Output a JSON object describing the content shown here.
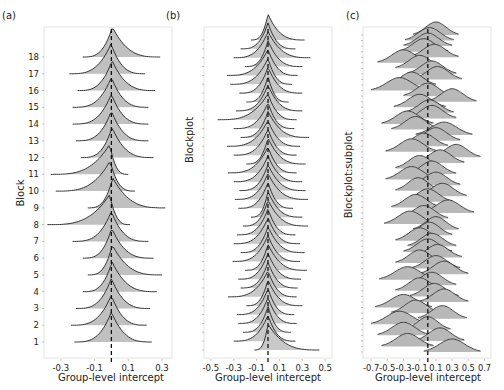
{
  "chart_data": [
    {
      "type": "ridgeline",
      "panel_label": "(a)",
      "title": "",
      "xlabel": "Group-level intercept",
      "ylabel": "Block",
      "xlim": [
        -0.4,
        0.36
      ],
      "xticks": [
        -0.3,
        -0.1,
        0.1,
        0.3
      ],
      "xtick_labels": [
        "-0.3",
        "-0.1",
        "0.1",
        "0.3"
      ],
      "yticks": [
        "1",
        "2",
        "3",
        "4",
        "5",
        "6",
        "7",
        "8",
        "9",
        "10",
        "11",
        "12",
        "13",
        "14",
        "15",
        "16",
        "17",
        "18"
      ],
      "reference_line": 0,
      "fill_color": "#c0c0c0",
      "line_color": "#222222",
      "rows": [
        {
          "label": "1",
          "left": -0.22,
          "right": 0.24,
          "skew": 0.0
        },
        {
          "label": "2",
          "left": -0.24,
          "right": 0.21,
          "skew": 0.0
        },
        {
          "label": "3",
          "left": -0.21,
          "right": 0.23,
          "skew": 0.0
        },
        {
          "label": "4",
          "left": -0.17,
          "right": 0.27,
          "skew": 0.02
        },
        {
          "label": "5",
          "left": -0.14,
          "right": 0.3,
          "skew": 0.03
        },
        {
          "label": "6",
          "left": -0.17,
          "right": 0.25,
          "skew": 0.01
        },
        {
          "label": "7",
          "left": -0.23,
          "right": 0.22,
          "skew": 0.0
        },
        {
          "label": "8",
          "left": -0.38,
          "right": 0.11,
          "skew": -0.05
        },
        {
          "label": "9",
          "left": -0.14,
          "right": 0.32,
          "skew": 0.04
        },
        {
          "label": "10",
          "left": -0.33,
          "right": 0.14,
          "skew": -0.04
        },
        {
          "label": "11",
          "left": -0.36,
          "right": 0.1,
          "skew": -0.05
        },
        {
          "label": "12",
          "left": -0.18,
          "right": 0.25,
          "skew": 0.02
        },
        {
          "label": "13",
          "left": -0.21,
          "right": 0.22,
          "skew": 0.0
        },
        {
          "label": "14",
          "left": -0.23,
          "right": 0.22,
          "skew": 0.0
        },
        {
          "label": "15",
          "left": -0.23,
          "right": 0.22,
          "skew": 0.0
        },
        {
          "label": "16",
          "left": -0.2,
          "right": 0.26,
          "skew": 0.02
        },
        {
          "label": "17",
          "left": -0.25,
          "right": 0.2,
          "skew": -0.01
        },
        {
          "label": "18",
          "left": -0.17,
          "right": 0.29,
          "skew": 0.03
        }
      ]
    },
    {
      "type": "ridgeline",
      "panel_label": "(b)",
      "title": "",
      "xlabel": "Group-level intercept",
      "ylabel": "Blockplot",
      "xlim": [
        -0.56,
        0.56
      ],
      "xticks": [
        -0.5,
        -0.3,
        -0.1,
        0.1,
        0.3,
        0.5
      ],
      "xtick_labels": [
        "-0.5",
        "-0.3",
        "-0.1",
        "0.1",
        "0.3",
        "0.5"
      ],
      "n_rows": 36,
      "reference_line": 0,
      "fill_color": "#c8c8c8",
      "line_color": "#222222",
      "rows_left": [
        -0.15,
        -0.24,
        -0.3,
        -0.2,
        -0.36,
        -0.33,
        -0.25,
        -0.19,
        -0.28,
        -0.44,
        -0.3,
        -0.24,
        -0.36,
        -0.3,
        -0.19,
        -0.35,
        -0.3,
        -0.25,
        -0.29,
        -0.26,
        -0.15,
        -0.22,
        -0.27,
        -0.3,
        -0.24,
        -0.31,
        -0.2,
        -0.26,
        -0.24,
        -0.35,
        -0.19,
        -0.27,
        -0.26,
        -0.22,
        -0.3,
        -0.12
      ],
      "rows_right": [
        0.32,
        0.24,
        0.37,
        0.3,
        0.26,
        0.21,
        0.3,
        0.18,
        0.3,
        0.25,
        0.23,
        0.36,
        0.28,
        0.25,
        0.33,
        0.25,
        0.3,
        0.33,
        0.35,
        0.22,
        0.3,
        0.35,
        0.24,
        0.28,
        0.32,
        0.28,
        0.34,
        0.29,
        0.26,
        0.25,
        0.3,
        0.23,
        0.25,
        0.2,
        0.24,
        0.45
      ]
    },
    {
      "type": "ridgeline",
      "panel_label": "(c)",
      "title": "",
      "xlabel": "Group-level intercept",
      "ylabel": "Blockplot:subplot",
      "xlim": [
        -0.8,
        0.78
      ],
      "xticks": [
        -0.7,
        -0.5,
        -0.3,
        -0.1,
        0.1,
        0.3,
        0.5,
        0.7
      ],
      "xtick_labels": [
        "-0.7",
        "-0.5",
        "-0.3",
        "-0.1",
        "0.1",
        "0.3",
        "0.5",
        "0.7"
      ],
      "n_rows": 58,
      "reference_line": 0,
      "fill_color": "#b8b8b8",
      "line_color": "#333333",
      "rows_center": [
        0.1,
        0.02,
        0.0,
        -0.05,
        0.08,
        -0.3,
        -0.1,
        0.05,
        0.12,
        -0.2,
        -0.35,
        0.0,
        0.3,
        -0.1,
        0.02,
        0.05,
        -0.25,
        -0.15,
        0.2,
        0.1,
        -0.05,
        -0.2,
        0.35,
        0.15,
        -0.1,
        0.05,
        -0.2,
        0.1,
        -0.12,
        0.18,
        0.0,
        -0.15,
        0.25,
        -0.05,
        -0.22,
        0.1,
        0.02,
        -0.1,
        0.05,
        0.0,
        0.12,
        -0.1,
        0.1,
        0.2,
        -0.25,
        0.05,
        -0.1,
        0.08,
        0.2,
        -0.3,
        -0.15,
        0.18,
        -0.35,
        0.0,
        -0.3,
        0.15,
        -0.25,
        0.3
      ],
      "rows_width": [
        0.28,
        0.3,
        0.3,
        0.3,
        0.3,
        0.32,
        0.3,
        0.3,
        0.3,
        0.3,
        0.35,
        0.3,
        0.3,
        0.32,
        0.3,
        0.3,
        0.32,
        0.3,
        0.35,
        0.3,
        0.3,
        0.32,
        0.3,
        0.3,
        0.3,
        0.3,
        0.32,
        0.3,
        0.28,
        0.3,
        0.3,
        0.3,
        0.32,
        0.3,
        0.32,
        0.28,
        0.28,
        0.3,
        0.3,
        0.3,
        0.3,
        0.3,
        0.3,
        0.3,
        0.35,
        0.3,
        0.3,
        0.3,
        0.3,
        0.35,
        0.3,
        0.3,
        0.35,
        0.28,
        0.32,
        0.3,
        0.32,
        0.35
      ]
    }
  ]
}
